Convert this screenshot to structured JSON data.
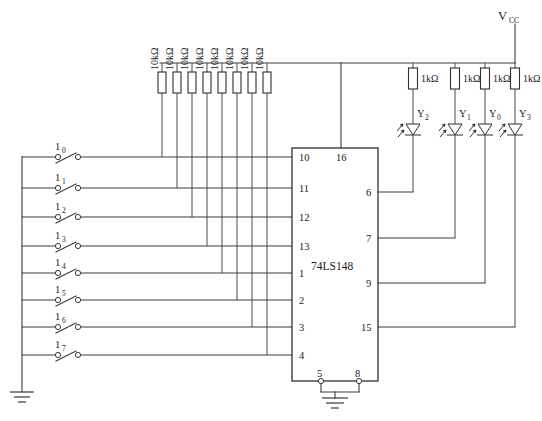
{
  "diagram": {
    "chip": {
      "label": "74LS148",
      "x": 292,
      "y": 148,
      "w": 86,
      "h": 233,
      "left_pins": [
        "10",
        "11",
        "12",
        "13",
        "1",
        "2",
        "3",
        "4"
      ],
      "right_pins": [
        "6",
        "7",
        "9",
        "15"
      ],
      "top_pin": "16",
      "bottom_pins": [
        "5",
        "8"
      ]
    },
    "power": {
      "label": "V",
      "sub": "CC",
      "rail_y": 63,
      "riser_x": 515
    },
    "pullups": {
      "value": "10kΩ",
      "count": 8,
      "x_positions": [
        162,
        177,
        192,
        207,
        222,
        237,
        252,
        267
      ],
      "top_y": 63,
      "res_y": 72,
      "res_h": 21,
      "res_w": 8
    },
    "inputs": {
      "switch_labels": [
        "I0",
        "I1",
        "I2",
        "I3",
        "I4",
        "I5",
        "I6",
        "I7"
      ],
      "switch_display": [
        "1",
        "1",
        "1",
        "1",
        "1",
        "1",
        "1",
        "1"
      ],
      "switch_subs": [
        "0",
        "1",
        "2",
        "3",
        "4",
        "5",
        "6",
        "7"
      ],
      "line_ys": [
        157,
        188,
        217,
        246,
        273,
        300,
        327,
        355
      ],
      "ground_rail_x": 22,
      "switch_x1": 56,
      "switch_x2": 78
    },
    "outputs": {
      "resistor_value": "1kΩ",
      "columns": [
        {
          "led": "Y",
          "sub": "2",
          "x": 413,
          "pin": "6",
          "pin_y": 192
        },
        {
          "led": "Y",
          "sub": "1",
          "x": 455,
          "pin": "7",
          "pin_y": 238
        },
        {
          "led": "Y",
          "sub": "0",
          "x": 485,
          "pin": "9",
          "pin_y": 283
        },
        {
          "led": "Y",
          "sub": "3",
          "x": 515,
          "pin": "15",
          "pin_y": 327
        }
      ],
      "res_y": 68,
      "res_h": 21,
      "res_w": 9,
      "led_y": 124
    },
    "ground_symbol": {
      "x": 22,
      "y": 392
    },
    "chip_ground": {
      "x": 335,
      "y": 405
    },
    "colors": {
      "wire": "#3a3a3a",
      "outline": "#2e2e2e",
      "text": "#1a1a1a",
      "background": "#ffffff"
    }
  }
}
